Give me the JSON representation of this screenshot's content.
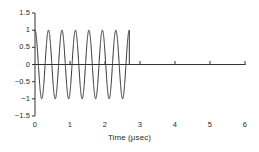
{
  "chart_data": {
    "type": "line",
    "title": "",
    "subtitle": "",
    "xlabel": "Time (μsec)",
    "ylabel": "",
    "xlim": [
      0,
      6
    ],
    "ylim": [
      -1.5,
      1.5
    ],
    "grid": false,
    "legend": null,
    "xticks": [
      {
        "value": 0,
        "label": "0"
      },
      {
        "value": 1,
        "label": "1"
      },
      {
        "value": 2,
        "label": "2"
      },
      {
        "value": 3,
        "label": "3"
      },
      {
        "value": 4,
        "label": "4"
      },
      {
        "value": 5,
        "label": "5"
      },
      {
        "value": 6,
        "label": "6"
      }
    ],
    "yticks": [
      {
        "value": 1.5,
        "label": "1.5"
      },
      {
        "value": 1.0,
        "label": "1"
      },
      {
        "value": 0.5,
        "label": "0.5"
      },
      {
        "value": 0.0,
        "label": "0"
      },
      {
        "value": -0.5,
        "label": "−0.5"
      },
      {
        "value": -1.0,
        "label": "−1"
      },
      {
        "value": -1.5,
        "label": "−1.5"
      }
    ],
    "series": [
      {
        "name": "tone burst",
        "color": "#333333",
        "linewidth": 1,
        "description": "Gated cosine tone burst: amplitude 1, period 0.385 usec (7 cycles), zero after t = 2.695 usec",
        "waveform": {
          "shape": "cosine-burst",
          "amplitude": 1.0,
          "period": 0.385,
          "cycles": 7,
          "start": 0.0,
          "end": 2.695,
          "tail_value": 0.0,
          "tail_end": 6.0
        }
      }
    ]
  },
  "axes": {
    "zero_line_label": "zero-axis",
    "tick_color": "#333333",
    "axis_color": "#333333"
  }
}
